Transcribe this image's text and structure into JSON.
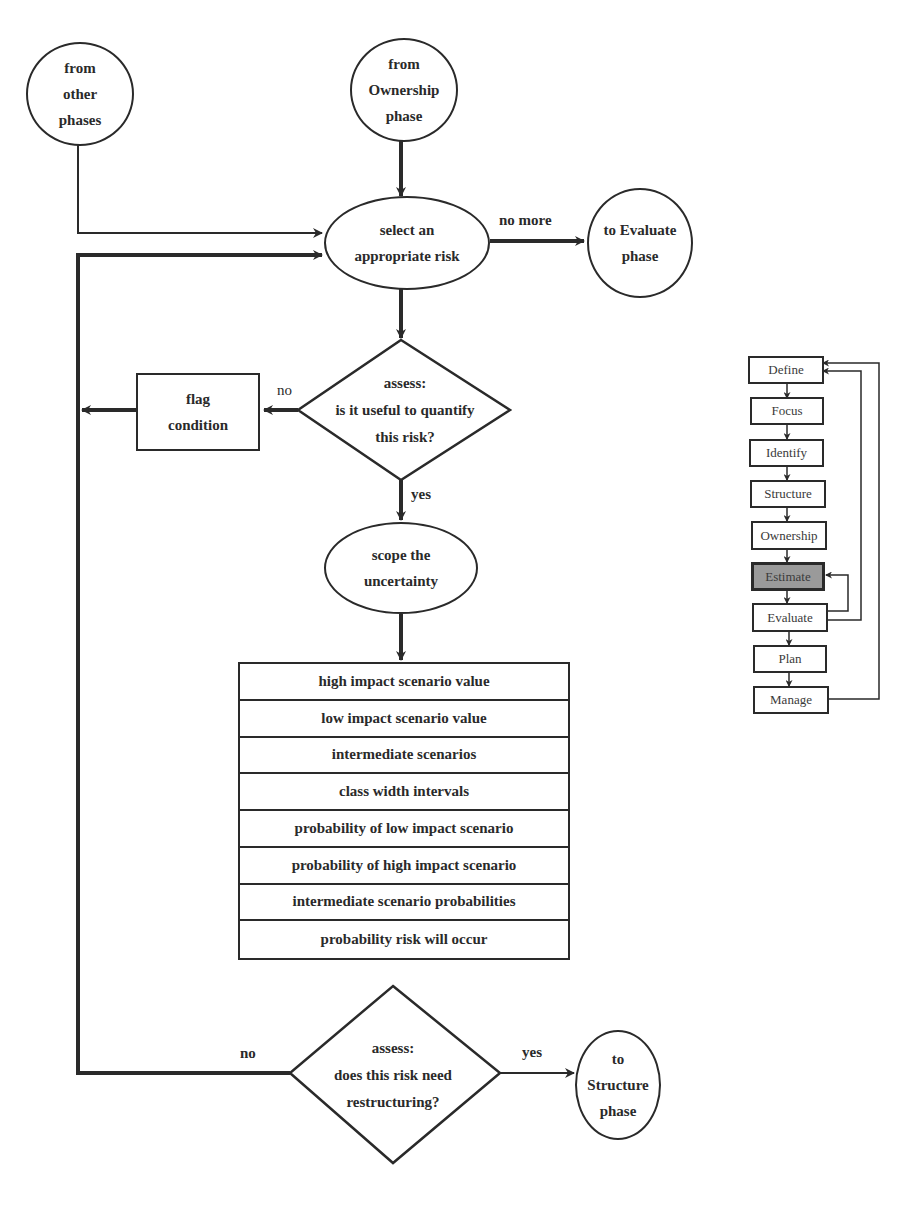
{
  "diagram": {
    "start_nodes": {
      "other_phases": "from\nother\nphases",
      "ownership": "from\nOwnership\nphase"
    },
    "select_risk": "select an appropriate risk",
    "no_more_label": "no more",
    "to_evaluate": "to Evaluate phase",
    "assess_quantify": {
      "line1": "assess:",
      "line2": "is it useful to quantify",
      "line3": "this risk?"
    },
    "no_label_1": "no",
    "flag_condition": "flag condition",
    "yes_label_1": "yes",
    "scope_uncertainty": "scope the uncertainty",
    "scope_steps": [
      "high impact scenario value",
      "low impact scenario value",
      "intermediate scenarios",
      "class width intervals",
      "probability of low impact scenario",
      "probability of high impact scenario",
      "intermediate scenario probabilities",
      "probability risk will occur"
    ],
    "assess_restructure": {
      "line1": "assess:",
      "line2": "does this risk need",
      "line3": "restructuring?"
    },
    "no_label_2": "no",
    "yes_label_2": "yes",
    "to_structure": "to Structure phase"
  },
  "phase_map": {
    "phases": [
      "Define",
      "Focus",
      "Identify",
      "Structure",
      "Ownership",
      "Estimate",
      "Evaluate",
      "Plan",
      "Manage"
    ],
    "active": "Estimate",
    "active_color": "#9a9a9a"
  }
}
